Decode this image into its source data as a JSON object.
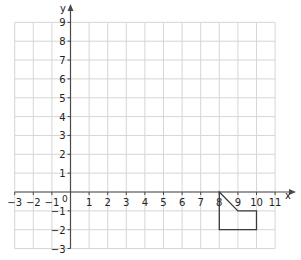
{
  "diagram": {
    "type": "coordinate-grid",
    "x_axis": {
      "label": "x",
      "min": -3,
      "max": 11,
      "ticks": [
        -3,
        -2,
        -1,
        1,
        2,
        3,
        4,
        5,
        6,
        7,
        8,
        9,
        10,
        11
      ]
    },
    "y_axis": {
      "label": "y",
      "min": -3,
      "max": 9,
      "ticks": [
        -3,
        -2,
        -1,
        1,
        2,
        3,
        4,
        5,
        6,
        7,
        8,
        9
      ]
    },
    "origin_label": "0",
    "shape": {
      "name": "polygon",
      "vertices": [
        [
          8,
          0
        ],
        [
          9,
          -1
        ],
        [
          10,
          -1
        ],
        [
          10,
          -2
        ],
        [
          8,
          -2
        ]
      ]
    },
    "colors": {
      "grid": "#d6d6d6",
      "axis": "#4a4a4a",
      "shape": "#3a3a3a",
      "text": "#222222"
    }
  }
}
